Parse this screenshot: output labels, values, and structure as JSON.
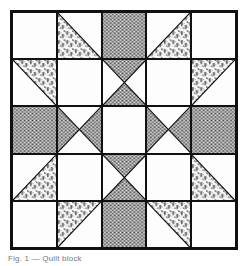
{
  "block": {
    "name": "patchwork-quilt-block",
    "title": "Quilt Block Pattern Diagram",
    "grid_rows": 5,
    "grid_columns": 5,
    "colors": {
      "background": "#ffffff",
      "line": "#111111",
      "solid_dark": "#808080",
      "light": "#fdfdfd",
      "print_ink": "#111111"
    },
    "fabrics": [
      {
        "key": "light",
        "label": "Light / Background"
      },
      {
        "key": "dark",
        "label": "Dark Solid"
      },
      {
        "key": "print",
        "label": "Floral Print"
      }
    ],
    "cells": [
      {
        "row": 1,
        "col": 1,
        "kind": "plain",
        "fill": "light",
        "note": "plain light square"
      },
      {
        "row": 1,
        "col": 2,
        "kind": "hst",
        "fill": "print",
        "corner": "bottom-left",
        "note": "half-square triangle, print lower-left"
      },
      {
        "row": 1,
        "col": 3,
        "kind": "plain",
        "fill": "dark",
        "note": "solid dark square"
      },
      {
        "row": 1,
        "col": 4,
        "kind": "hst",
        "fill": "print",
        "corner": "bottom-right",
        "note": "half-square triangle, print lower-right"
      },
      {
        "row": 1,
        "col": 5,
        "kind": "plain",
        "fill": "light",
        "note": "plain light square"
      },
      {
        "row": 2,
        "col": 1,
        "kind": "hst",
        "fill": "print",
        "corner": "top-right",
        "note": "half-square triangle, print upper-right"
      },
      {
        "row": 2,
        "col": 2,
        "kind": "plain",
        "fill": "light",
        "note": "plain light square"
      },
      {
        "row": 2,
        "col": 3,
        "kind": "hourglass",
        "fill": "dark",
        "orient": "vertical",
        "note": "hourglass, dark top and bottom triangles"
      },
      {
        "row": 2,
        "col": 4,
        "kind": "plain",
        "fill": "light",
        "note": "plain light square"
      },
      {
        "row": 2,
        "col": 5,
        "kind": "hst",
        "fill": "print",
        "corner": "top-left",
        "note": "half-square triangle, print upper-left"
      },
      {
        "row": 3,
        "col": 1,
        "kind": "plain",
        "fill": "dark",
        "note": "solid dark square"
      },
      {
        "row": 3,
        "col": 2,
        "kind": "hourglass",
        "fill": "dark",
        "orient": "horizontal",
        "note": "hourglass, dark left and right triangles"
      },
      {
        "row": 3,
        "col": 3,
        "kind": "plain",
        "fill": "light",
        "note": "plain light center square"
      },
      {
        "row": 3,
        "col": 4,
        "kind": "hourglass",
        "fill": "dark",
        "orient": "horizontal",
        "note": "hourglass, dark left and right triangles"
      },
      {
        "row": 3,
        "col": 5,
        "kind": "plain",
        "fill": "dark",
        "note": "solid dark square"
      },
      {
        "row": 4,
        "col": 1,
        "kind": "hst",
        "fill": "print",
        "corner": "bottom-right",
        "note": "half-square triangle, print lower-right"
      },
      {
        "row": 4,
        "col": 2,
        "kind": "plain",
        "fill": "light",
        "note": "plain light square"
      },
      {
        "row": 4,
        "col": 3,
        "kind": "hourglass",
        "fill": "dark",
        "orient": "vertical",
        "note": "hourglass, dark top and bottom triangles"
      },
      {
        "row": 4,
        "col": 4,
        "kind": "plain",
        "fill": "light",
        "note": "plain light square"
      },
      {
        "row": 4,
        "col": 5,
        "kind": "hst",
        "fill": "print",
        "corner": "bottom-left",
        "note": "half-square triangle, print lower-left"
      },
      {
        "row": 5,
        "col": 1,
        "kind": "plain",
        "fill": "light",
        "note": "plain light square"
      },
      {
        "row": 5,
        "col": 2,
        "kind": "hst",
        "fill": "print",
        "corner": "top-left",
        "note": "half-square triangle, print upper-left"
      },
      {
        "row": 5,
        "col": 3,
        "kind": "plain",
        "fill": "dark",
        "note": "solid dark square"
      },
      {
        "row": 5,
        "col": 4,
        "kind": "hst",
        "fill": "print",
        "corner": "top-right",
        "note": "half-square triangle, print upper-right"
      },
      {
        "row": 5,
        "col": 5,
        "kind": "plain",
        "fill": "light",
        "note": "plain light square"
      }
    ]
  },
  "caption": {
    "text": "Fig. 1 — Quilt block"
  }
}
